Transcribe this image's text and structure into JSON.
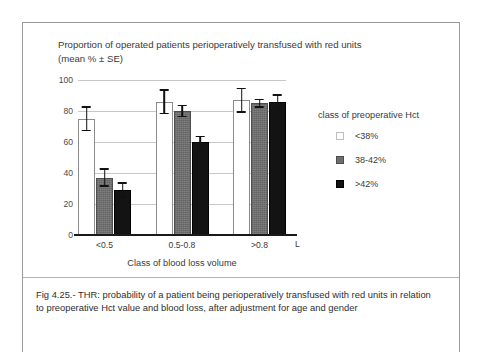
{
  "figure": {
    "title_line1": "Proportion of operated patients perioperatively transfused with red units",
    "title_line2": "(mean %  ± SE)",
    "caption": "Fig 4.25.- THR: probability of a patient  being perioperatively  transfused with red units  in relation to preoperative Hct value and blood loss, after adjustment for age and gender",
    "stray_axis_label": "L"
  },
  "legend": {
    "title": "class of preoperative Hct",
    "items": [
      {
        "label": "<38%",
        "swatch": "white-swatch-icon",
        "color": "#ffffff"
      },
      {
        "label": "38-42%",
        "swatch": "grey-swatch-icon",
        "color": "#6f6f6f"
      },
      {
        "label": ">42%",
        "swatch": "black-swatch-icon",
        "color": "#111111"
      }
    ]
  },
  "chart_data": {
    "type": "bar",
    "title": "Proportion of operated patients perioperatively transfused with red units (mean % ± SE)",
    "xlabel": "Class of blood loss volume",
    "ylabel": "",
    "ylim": [
      0,
      100
    ],
    "yticks": [
      0,
      20,
      40,
      60,
      80,
      100
    ],
    "grid": true,
    "legend_position": "right",
    "categories": [
      "<0.5",
      "0.5-0.8",
      ">0.8"
    ],
    "series": [
      {
        "name": "<38%",
        "values": [
          75,
          86,
          87
        ],
        "errors": [
          8,
          8,
          8
        ]
      },
      {
        "name": "38-42%",
        "values": [
          37,
          80,
          85
        ],
        "errors": [
          6,
          4,
          3
        ]
      },
      {
        "name": ">42%",
        "values": [
          29,
          60,
          86
        ],
        "errors": [
          5,
          4,
          5
        ]
      }
    ]
  }
}
